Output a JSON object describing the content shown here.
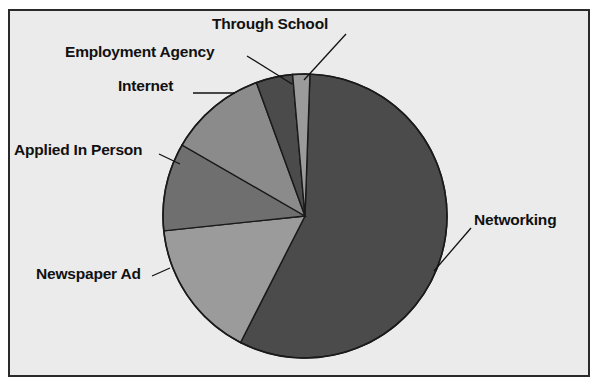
{
  "figure": {
    "background_color": "#ebebeb",
    "border_color": "#2a2a2a",
    "page_background": "#ffffff"
  },
  "chart_data": {
    "type": "pie",
    "title": "",
    "subtitle": "",
    "xlabel": "",
    "ylabel": "",
    "legend_position": "none",
    "grid": false,
    "labels_position": "outside-with-leader-lines",
    "start_angle_deg": 0,
    "direction": "clockwise",
    "categories": [
      "Networking",
      "Newspaper Ad",
      "Applied In Person",
      "Internet",
      "Employment Agency",
      "Through School"
    ],
    "values": [
      57,
      16,
      10,
      11,
      4,
      2
    ],
    "slices": [
      {
        "label": "Networking",
        "value": 57,
        "percent": 57,
        "color": "#4b4b4b",
        "start_deg": 2,
        "end_deg": 207
      },
      {
        "label": "Newspaper Ad",
        "value": 16,
        "percent": 16,
        "color": "#9b9b9b",
        "start_deg": 207,
        "end_deg": 264
      },
      {
        "label": "Applied In Person",
        "value": 10,
        "percent": 10,
        "color": "#6f6f6f",
        "start_deg": 264,
        "end_deg": 300
      },
      {
        "label": "Internet",
        "value": 11,
        "percent": 11,
        "color": "#8b8b8b",
        "start_deg": 300,
        "end_deg": 340
      },
      {
        "label": "Employment Agency",
        "value": 4,
        "percent": 4,
        "color": "#4b4b4b",
        "start_deg": 340,
        "end_deg": 355
      },
      {
        "label": "Through School",
        "value": 2,
        "percent": 2,
        "color": "#9b9b9b",
        "start_deg": 355,
        "end_deg": 362
      }
    ],
    "geometry": {
      "center_x": 305,
      "center_y": 216,
      "radius": 142,
      "outline_color": "#1a1a1a"
    }
  },
  "labels": {
    "through_school": "Through School",
    "employment_agency": "Employment Agency",
    "internet": "Internet",
    "applied_in_person": "Applied In Person",
    "newspaper_ad": "Newspaper Ad",
    "networking": "Networking"
  }
}
